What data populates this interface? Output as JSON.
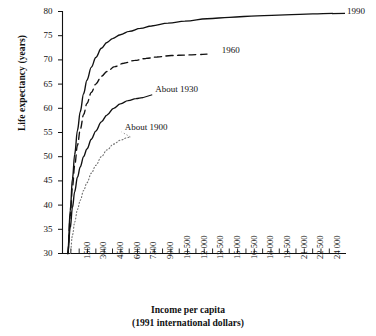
{
  "chart_data": {
    "type": "line",
    "title": "",
    "xlabel": "Income per capita",
    "xlabel_sub": "(1991 international dollars)",
    "ylabel": "Life expectancy (years)",
    "xlim": [
      0,
      25500
    ],
    "ylim": [
      30,
      80
    ],
    "grid": false,
    "legend_position": "inline-end-of-line",
    "x_tick_labels": [
      "1500",
      "3000",
      "4500",
      "6000",
      "7500",
      "9000",
      "10 500",
      "12 000",
      "13 500",
      "15 000",
      "16 500",
      "18 000",
      "19 500",
      "21 000",
      "22 500",
      "24 000"
    ],
    "x_tick_values": [
      1500,
      3000,
      4500,
      6000,
      7500,
      9000,
      10500,
      12000,
      13500,
      15000,
      16500,
      18000,
      19500,
      21000,
      22500,
      24000
    ],
    "x_minor_tick_count": 32,
    "y_tick_labels": [
      "30",
      "35",
      "40",
      "45",
      "50",
      "55",
      "60",
      "65",
      "70",
      "75",
      "80"
    ],
    "y_tick_values": [
      30,
      35,
      40,
      45,
      50,
      55,
      60,
      65,
      70,
      75,
      80
    ],
    "series": [
      {
        "name": "1990",
        "label": "1990",
        "style": "solid",
        "color": "#111111",
        "label_x": 24600,
        "label_y": 79.6,
        "x": [
          480,
          700,
          900,
          1100,
          1350,
          1600,
          1900,
          2200,
          2600,
          3000,
          3500,
          4000,
          4500,
          5200,
          6000,
          7000,
          8000,
          9500,
          11000,
          13000,
          15000,
          17500,
          20000,
          22500,
          24300
        ],
        "y": [
          30.0,
          39.0,
          45.5,
          50.5,
          55.5,
          59.3,
          63.0,
          65.8,
          68.5,
          70.5,
          72.4,
          73.6,
          74.4,
          75.2,
          75.9,
          76.5,
          77.0,
          77.6,
          78.0,
          78.5,
          78.8,
          79.1,
          79.3,
          79.5,
          79.6
        ]
      },
      {
        "name": "1960",
        "label": "1960",
        "style": "dashed",
        "color": "#111111",
        "label_x": 13250,
        "label_y": 71.5,
        "x": [
          480,
          700,
          900,
          1100,
          1350,
          1600,
          1900,
          2200,
          2600,
          3000,
          3500,
          4000,
          4700,
          5500,
          6500,
          7500,
          8500,
          9800,
          11000,
          12200,
          13000
        ],
        "y": [
          30.0,
          37.8,
          43.8,
          48.2,
          52.4,
          55.6,
          58.7,
          61.0,
          63.3,
          65.0,
          66.6,
          67.6,
          68.6,
          69.3,
          69.9,
          70.3,
          70.6,
          70.9,
          71.0,
          71.1,
          71.2
        ]
      },
      {
        "name": "About 1930",
        "label": "About 1930",
        "style": "solid",
        "color": "#111111",
        "label_x": 7800,
        "label_y": 62.6,
        "x": [
          480,
          700,
          900,
          1100,
          1350,
          1600,
          1900,
          2200,
          2600,
          3000,
          3500,
          4000,
          4600,
          5200,
          5900,
          6600,
          7200
        ],
        "y": [
          30.0,
          35.4,
          39.6,
          42.8,
          45.8,
          47.9,
          50.0,
          51.6,
          53.6,
          55.3,
          57.2,
          58.6,
          60.0,
          60.9,
          61.6,
          62.0,
          62.2
        ]
      },
      {
        "name": "About 1900",
        "label": "About 1900",
        "style": "dotted",
        "color": "#6f6f6f",
        "label_x": 5050,
        "label_y": 55.0,
        "x": [
          700,
          900,
          1100,
          1350,
          1600,
          1900,
          2200,
          2600,
          3000,
          3500,
          4000,
          4600,
          5200,
          5800,
          6100
        ],
        "y": [
          30.0,
          33.8,
          36.5,
          39.1,
          41.0,
          43.0,
          44.6,
          46.6,
          48.2,
          50.0,
          51.4,
          52.6,
          53.4,
          53.9,
          54.1
        ]
      }
    ]
  },
  "axes": {
    "y_axis_title": "Life expectancy (years)",
    "x_axis_title_line1": "Income per capita",
    "x_axis_title_line2": "(1991 international dollars)"
  }
}
